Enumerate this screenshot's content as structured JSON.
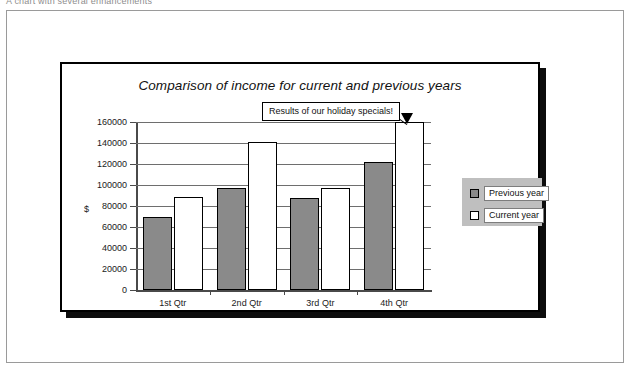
{
  "document": {
    "caption": "A chart with several enhancements"
  },
  "chart_data": {
    "type": "bar",
    "title": "Comparison of income for current and previous years",
    "xlabel": "",
    "ylabel": "$",
    "categories": [
      "1st Qtr",
      "2nd Qtr",
      "3rd Qtr",
      "4th Qtr"
    ],
    "series": [
      {
        "name": "Previous year",
        "color": "#8a8a8a",
        "values": [
          70000,
          97000,
          88000,
          122000
        ]
      },
      {
        "name": "Current year",
        "color": "#ffffff",
        "values": [
          89000,
          141000,
          97000,
          160000
        ]
      }
    ],
    "ylim": [
      0,
      160000
    ],
    "ytick_labels": [
      "160000",
      "140000",
      "120000",
      "100000",
      "80000",
      "60000",
      "40000",
      "20000",
      "0"
    ],
    "ytick_values": [
      160000,
      140000,
      120000,
      100000,
      80000,
      60000,
      40000,
      20000,
      0
    ],
    "grid": true,
    "legend_position": "right",
    "annotations": [
      {
        "text": "Results of our holiday specials!",
        "points_to": "4th Qtr Current year"
      }
    ]
  }
}
